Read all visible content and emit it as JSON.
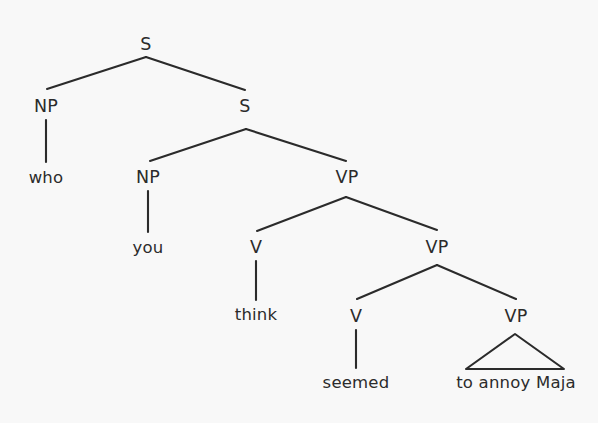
{
  "figure": {
    "type": "syntax-tree",
    "sentence": "who you think seemed to annoy Maja",
    "background_color": "#f8f8f8",
    "line_color": "#2b2b2b",
    "text_color": "#2b2b2b"
  },
  "nodes": {
    "s_root": {
      "label": "S",
      "x": 146,
      "y": 45
    },
    "np_who": {
      "label": "NP",
      "x": 46,
      "y": 107
    },
    "word_who": {
      "label": "who",
      "x": 46,
      "y": 178
    },
    "s_embedded": {
      "label": "S",
      "x": 245,
      "y": 107
    },
    "np_you": {
      "label": "NP",
      "x": 148,
      "y": 178
    },
    "word_you": {
      "label": "you",
      "x": 148,
      "y": 248
    },
    "vp_upper": {
      "label": "VP",
      "x": 347,
      "y": 178
    },
    "v_think": {
      "label": "V",
      "x": 256,
      "y": 248
    },
    "word_think": {
      "label": "think",
      "x": 256,
      "y": 315
    },
    "vp_middle": {
      "label": "VP",
      "x": 437,
      "y": 248
    },
    "v_seemed": {
      "label": "V",
      "x": 356,
      "y": 317
    },
    "word_seemed": {
      "label": "seemed",
      "x": 356,
      "y": 383
    },
    "vp_triangle": {
      "label": "VP",
      "x": 516,
      "y": 317
    },
    "phrase_to_annoy_maja": {
      "label": "to annoy Maja",
      "x": 516,
      "y": 383
    }
  },
  "edges": [
    {
      "name": "s-root-to-np-who",
      "x1": 146,
      "y1": 57,
      "x2": 47,
      "y2": 89
    },
    {
      "name": "s-root-to-s-embedded",
      "x1": 146,
      "y1": 57,
      "x2": 245,
      "y2": 90
    },
    {
      "name": "np-who-to-who",
      "x1": 46,
      "y1": 120,
      "x2": 46,
      "y2": 162
    },
    {
      "name": "s-embedded-to-np-you",
      "x1": 246,
      "y1": 129,
      "x2": 150,
      "y2": 161
    },
    {
      "name": "s-embedded-to-vp-upper",
      "x1": 246,
      "y1": 129,
      "x2": 346,
      "y2": 161
    },
    {
      "name": "np-you-to-you",
      "x1": 148,
      "y1": 191,
      "x2": 148,
      "y2": 232
    },
    {
      "name": "vp-upper-to-v-think",
      "x1": 346,
      "y1": 197,
      "x2": 257,
      "y2": 231
    },
    {
      "name": "vp-upper-to-vp-middle",
      "x1": 346,
      "y1": 197,
      "x2": 437,
      "y2": 230
    },
    {
      "name": "v-think-to-think",
      "x1": 256,
      "y1": 261,
      "x2": 256,
      "y2": 300
    },
    {
      "name": "vp-middle-to-v-seemed",
      "x1": 437,
      "y1": 265,
      "x2": 357,
      "y2": 299
    },
    {
      "name": "vp-middle-to-vp-triangle",
      "x1": 437,
      "y1": 265,
      "x2": 516,
      "y2": 299
    },
    {
      "name": "v-seemed-to-seemed",
      "x1": 356,
      "y1": 330,
      "x2": 356,
      "y2": 368
    }
  ],
  "triangle": {
    "name": "vp-triangle-shape",
    "apex_x": 515,
    "apex_y": 334,
    "base_left_x": 466,
    "base_right_x": 564,
    "base_y": 369
  }
}
